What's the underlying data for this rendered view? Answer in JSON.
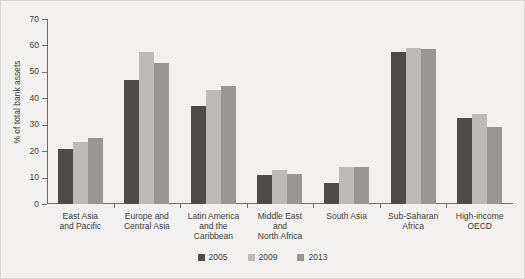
{
  "chart_data": {
    "type": "bar",
    "title": "",
    "xlabel": "",
    "ylabel": "% of total bank assets",
    "ylim": [
      0,
      70
    ],
    "ytick_labels": [
      "0",
      "10",
      "20",
      "30",
      "40",
      "50",
      "60",
      "70"
    ],
    "ytick_values": [
      0,
      10,
      20,
      30,
      40,
      50,
      60,
      70
    ],
    "grid": false,
    "legend_position": "bottom-center",
    "categories": [
      "East Asia\nand Pacific",
      "Europe and\nCentral Asia",
      "Latin America\nand the\nCaribbean",
      "Middle East\nand\nNorth Africa",
      "South Asia",
      "Sub-Saharan\nAfrica",
      "High-income\nOECD"
    ],
    "category_lines": [
      [
        "East Asia",
        "and Pacific"
      ],
      [
        "Europe and",
        "Central Asia"
      ],
      [
        "Latin America",
        "and the",
        "Caribbean"
      ],
      [
        "Middle East",
        "and",
        "North Africa"
      ],
      [
        "South Asia"
      ],
      [
        "Sub-Saharan",
        "Africa"
      ],
      [
        "High-income",
        "OECD"
      ]
    ],
    "series": [
      {
        "name": "2005",
        "color": "#4d4c4a",
        "values": [
          20.7,
          47.0,
          37.0,
          11.0,
          8.0,
          57.5,
          32.5
        ]
      },
      {
        "name": "2009",
        "color": "#bcbab7",
        "values": [
          23.5,
          57.5,
          43.0,
          13.0,
          14.0,
          59.0,
          34.0
        ]
      },
      {
        "name": "2013",
        "color": "#989693",
        "values": [
          25.0,
          53.5,
          44.5,
          11.5,
          14.0,
          58.5,
          29.0
        ]
      }
    ]
  },
  "legend": {
    "items": [
      {
        "label": "2005"
      },
      {
        "label": "2009"
      },
      {
        "label": "2013"
      }
    ]
  },
  "colors": {
    "background": "#f2f1ef",
    "axis": "#6d6b68",
    "text": "#3d3b39",
    "series_2005": "#4d4c4a",
    "series_2009": "#bcbab7",
    "series_2013": "#989693"
  }
}
